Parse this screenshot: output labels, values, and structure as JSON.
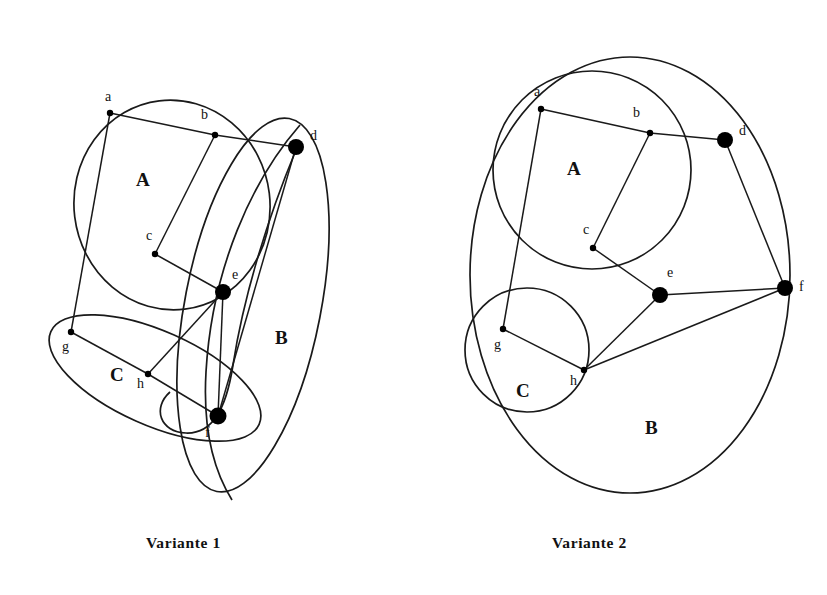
{
  "figure": {
    "captions": [
      {
        "id": "cap1",
        "text": "Variante  1"
      },
      {
        "id": "cap2",
        "text": "Variante  2"
      }
    ]
  },
  "colors": {
    "dark_fill": "#a5a5a5",
    "light_fill": "#cccccc",
    "stroke": "#1a1a1a",
    "node": "#000000",
    "background": "#ffffff"
  },
  "variante1": {
    "caption": "Variante  1",
    "regions": [
      {
        "name": "A",
        "label": "A",
        "shape": "circle",
        "label_x": 136,
        "label_y": 186,
        "fill": "dark"
      },
      {
        "name": "B",
        "label": "B",
        "shape": "ellipse",
        "label_x": 275,
        "label_y": 344,
        "fill": "light"
      },
      {
        "name": "C",
        "label": "C",
        "shape": "ellipse",
        "label_x": 110,
        "label_y": 381,
        "fill": "dark"
      }
    ],
    "nodes": [
      {
        "id": "a",
        "label": "a",
        "x": 110,
        "y": 113,
        "r": 3.2,
        "label_x": 105,
        "label_y": 101,
        "big": false
      },
      {
        "id": "b",
        "label": "b",
        "x": 215,
        "y": 135,
        "r": 3.2,
        "label_x": 201,
        "label_y": 119,
        "big": false
      },
      {
        "id": "c",
        "label": "c",
        "x": 155,
        "y": 254,
        "r": 3.2,
        "label_x": 146,
        "label_y": 240,
        "big": false
      },
      {
        "id": "d",
        "label": "d",
        "x": 296,
        "y": 147,
        "r": 8.0,
        "label_x": 310,
        "label_y": 140,
        "big": true
      },
      {
        "id": "e",
        "label": "e",
        "x": 223,
        "y": 292,
        "r": 8.0,
        "label_x": 232,
        "label_y": 279,
        "big": true
      },
      {
        "id": "f",
        "label": "f",
        "x": 218,
        "y": 416,
        "r": 8.5,
        "label_x": 205,
        "label_y": 437,
        "big": true
      },
      {
        "id": "g",
        "label": "g",
        "x": 71,
        "y": 332,
        "r": 3.2,
        "label_x": 62,
        "label_y": 351,
        "big": false
      },
      {
        "id": "h",
        "label": "h",
        "x": 148,
        "y": 374,
        "r": 3.2,
        "label_x": 137,
        "label_y": 388,
        "big": false
      }
    ],
    "edges": [
      {
        "from": "a",
        "to": "b"
      },
      {
        "from": "b",
        "to": "d"
      },
      {
        "from": "b",
        "to": "c"
      },
      {
        "from": "c",
        "to": "e"
      },
      {
        "from": "a",
        "to": "g"
      },
      {
        "from": "g",
        "to": "h"
      },
      {
        "from": "h",
        "to": "f"
      },
      {
        "from": "e",
        "to": "h"
      },
      {
        "from": "e",
        "to": "f"
      },
      {
        "from": "d",
        "to": "f"
      }
    ]
  },
  "variante2": {
    "caption": "Variante  2",
    "regions": [
      {
        "name": "B",
        "label": "B",
        "shape": "ellipse",
        "label_x": 645,
        "label_y": 434,
        "fill": "light"
      },
      {
        "name": "A",
        "label": "A",
        "shape": "circle",
        "label_x": 567,
        "label_y": 175,
        "fill": "dark"
      },
      {
        "name": "C",
        "label": "C",
        "shape": "circle",
        "label_x": 516,
        "label_y": 397,
        "fill": "dark"
      }
    ],
    "nodes": [
      {
        "id": "a",
        "label": "a",
        "x": 541,
        "y": 109,
        "r": 3.2,
        "label_x": 534,
        "label_y": 96,
        "big": false
      },
      {
        "id": "b",
        "label": "b",
        "x": 650,
        "y": 133,
        "r": 3.2,
        "label_x": 633,
        "label_y": 117,
        "big": false
      },
      {
        "id": "c",
        "label": "c",
        "x": 593,
        "y": 248,
        "r": 3.2,
        "label_x": 583,
        "label_y": 234,
        "big": false
      },
      {
        "id": "d",
        "label": "d",
        "x": 725,
        "y": 140,
        "r": 8.0,
        "label_x": 739,
        "label_y": 135,
        "big": true
      },
      {
        "id": "e",
        "label": "e",
        "x": 660,
        "y": 295,
        "r": 8.0,
        "label_x": 667,
        "label_y": 277,
        "big": true
      },
      {
        "id": "f",
        "label": "f",
        "x": 785,
        "y": 288,
        "r": 8.0,
        "label_x": 799,
        "label_y": 291,
        "big": true
      },
      {
        "id": "g",
        "label": "g",
        "x": 503,
        "y": 329,
        "r": 3.2,
        "label_x": 494,
        "label_y": 349,
        "big": false
      },
      {
        "id": "h",
        "label": "h",
        "x": 584,
        "y": 370,
        "r": 3.2,
        "label_x": 570,
        "label_y": 385,
        "big": false
      }
    ],
    "edges": [
      {
        "from": "a",
        "to": "b"
      },
      {
        "from": "b",
        "to": "d"
      },
      {
        "from": "b",
        "to": "c"
      },
      {
        "from": "c",
        "to": "e"
      },
      {
        "from": "a",
        "to": "g"
      },
      {
        "from": "g",
        "to": "h"
      },
      {
        "from": "h",
        "to": "f"
      },
      {
        "from": "e",
        "to": "h"
      },
      {
        "from": "e",
        "to": "f"
      },
      {
        "from": "d",
        "to": "f"
      }
    ]
  }
}
